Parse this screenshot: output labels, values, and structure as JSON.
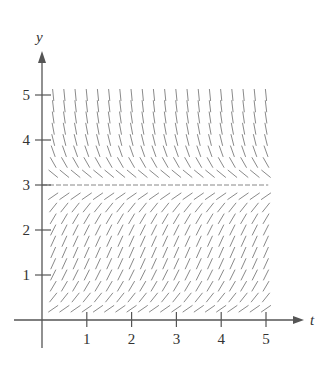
{
  "chart_data": {
    "type": "slope_field",
    "title": "",
    "xlabel": "t",
    "ylabel": "y",
    "xlim": [
      0,
      5
    ],
    "ylim": [
      0,
      5
    ],
    "x_ticks": [
      1,
      2,
      3,
      4,
      5
    ],
    "y_ticks": [
      1,
      2,
      3,
      4,
      5
    ],
    "x_tick_labels": [
      "1",
      "2",
      "3",
      "4",
      "5"
    ],
    "y_tick_labels": [
      "1",
      "2",
      "3",
      "4",
      "5"
    ],
    "grid": false,
    "equilibrium_lines": [
      {
        "y": 3,
        "style": "dashed"
      }
    ],
    "slope_function": "dy/dt = y(3 - y)",
    "field_sampling": {
      "t_start": 0.25,
      "t_end": 5,
      "t_step": 0.25,
      "y_start": 0.25,
      "y_end": 5,
      "y_step": 0.25
    }
  },
  "colors": {
    "axis": "#555555",
    "segment": "#8a8a8a",
    "text": "#333333"
  }
}
